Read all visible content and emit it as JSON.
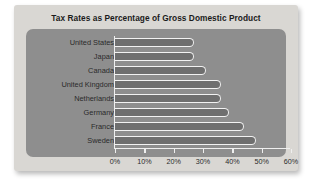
{
  "card": {
    "title": "Tax Rates as Percentage of Gross Domestic Product"
  },
  "colors": {
    "card_background": "#d9d7d3",
    "panel_background": "#8e8e8e",
    "bar_fill": "#6f6f6f",
    "bar_outline": "#f2f2f2",
    "axis": "#efefef",
    "text": "#2a2a2a",
    "title_text": "#1b1b1b"
  },
  "chart_data": {
    "type": "bar",
    "orientation": "horizontal",
    "title": "Tax Rates as Percentage of Gross Domestic Product",
    "xlabel": "",
    "ylabel": "",
    "categories": [
      "United States",
      "Japan",
      "Canada",
      "United Kingdom",
      "Netherlands",
      "Germany",
      "France",
      "Sweden"
    ],
    "values": [
      27,
      27,
      31,
      36,
      36,
      39,
      44,
      48
    ],
    "xlim": [
      0,
      60
    ],
    "xticks": [
      0,
      10,
      20,
      30,
      40,
      50,
      60
    ],
    "xticklabels": [
      "0%",
      "10%",
      "20%",
      "30%",
      "40%",
      "50%",
      "60%"
    ],
    "grid": false,
    "legend": false
  }
}
